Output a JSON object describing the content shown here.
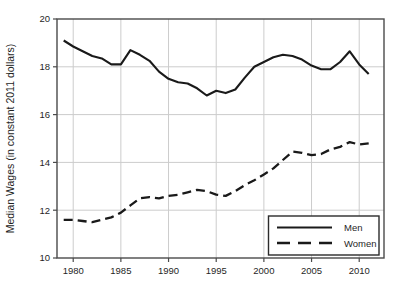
{
  "chart_data": {
    "type": "line",
    "title": "",
    "xlabel": "",
    "ylabel": "Median Wages (in constant 2011 dollars)",
    "xlim": [
      1978.3,
      2012.6
    ],
    "ylim": [
      10,
      20
    ],
    "x_ticks": [
      1980,
      1985,
      1990,
      1995,
      2000,
      2005,
      2010
    ],
    "x_tick_labels": [
      "1980",
      "1985",
      "1990",
      "1995",
      "2000",
      "2005",
      "2010"
    ],
    "y_ticks": [
      10,
      12,
      14,
      16,
      18,
      20
    ],
    "y_tick_labels": [
      "10",
      "12",
      "14",
      "16",
      "18",
      "20"
    ],
    "grid": true,
    "legend_position": "lower right",
    "x": [
      1979,
      1980,
      1981,
      1982,
      1983,
      1984,
      1985,
      1986,
      1987,
      1988,
      1989,
      1990,
      1991,
      1992,
      1993,
      1994,
      1995,
      1996,
      1997,
      1998,
      1999,
      2000,
      2001,
      2002,
      2003,
      2004,
      2005,
      2006,
      2007,
      2008,
      2009,
      2010,
      2011
    ],
    "series": [
      {
        "name": "Men",
        "line_style": "solid",
        "color": "#1a1a1a",
        "values": [
          19.1,
          18.85,
          18.65,
          18.45,
          18.35,
          18.1,
          18.1,
          18.7,
          18.5,
          18.25,
          17.8,
          17.5,
          17.35,
          17.3,
          17.1,
          16.8,
          17.0,
          16.9,
          17.05,
          17.55,
          18.0,
          18.2,
          18.4,
          18.5,
          18.45,
          18.3,
          18.05,
          17.9,
          17.9,
          18.2,
          18.65,
          18.1,
          17.7
        ]
      },
      {
        "name": "Women",
        "line_style": "dashed",
        "color": "#1a1a1a",
        "values": [
          11.6,
          11.6,
          11.55,
          11.5,
          11.6,
          11.7,
          11.9,
          12.2,
          12.5,
          12.55,
          12.5,
          12.6,
          12.65,
          12.75,
          12.85,
          12.8,
          12.65,
          12.6,
          12.8,
          13.05,
          13.25,
          13.5,
          13.75,
          14.1,
          14.45,
          14.4,
          14.3,
          14.35,
          14.55,
          14.65,
          14.85,
          14.75,
          14.8
        ]
      }
    ]
  },
  "legend": {
    "entries": [
      {
        "label": "Men",
        "sample": "solid-line"
      },
      {
        "label": "Women",
        "sample": "dashed-line"
      }
    ]
  },
  "colors": {
    "background": "#ffffff",
    "axis_border": "#4a4a4a",
    "gridline": "#cccccc",
    "tick": "#4a4a4a",
    "text": "#1f1f1f",
    "series_line": "#1a1a1a",
    "legend_border": "#2b2b2b",
    "legend_fill": "#ffffff"
  }
}
